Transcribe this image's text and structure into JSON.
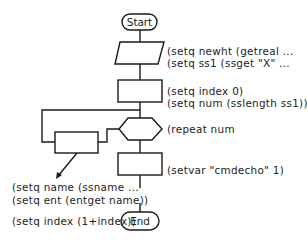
{
  "diagram": {
    "type": "flowchart",
    "nodes": {
      "start": {
        "label": "Start",
        "shape": "terminator"
      },
      "input": {
        "label": "",
        "shape": "parallelogram"
      },
      "init": {
        "label": "",
        "shape": "process"
      },
      "repeat": {
        "label": "",
        "shape": "hexagon"
      },
      "loop_body": {
        "label": "",
        "shape": "process"
      },
      "setvar": {
        "label": "",
        "shape": "process"
      },
      "end": {
        "label": "End",
        "shape": "terminator"
      }
    },
    "annotations": {
      "input_line1": "(setq newht (getreal ...",
      "input_line2": "(setq ss1 (ssget \"X\" ...",
      "init_line1": "(setq index 0)",
      "init_line2": "(setq num (sslength ss1))",
      "repeat_line1": "(repeat num",
      "setvar_line1": "(setvar \"cmdecho\" 1)",
      "loop_line1": "(setq name (ssname ...",
      "loop_line2": "(setq ent (entget name))",
      "loop_line3": "(setq index (1+index))"
    },
    "colors": {
      "stroke": "#1a1a1a",
      "text": "#222222",
      "background": "#ffffff"
    }
  }
}
